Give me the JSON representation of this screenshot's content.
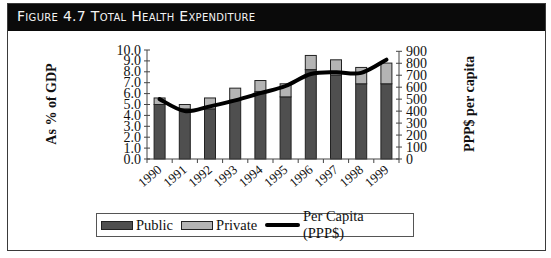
{
  "figure": {
    "title": "Figure 4.7 Total Health Expenditure"
  },
  "legend": {
    "items": [
      {
        "label": "Public",
        "type": "bar",
        "color": "#4f4f4f"
      },
      {
        "label": "Private",
        "type": "bar",
        "color": "#b4b4b4"
      },
      {
        "label": "Per Capita (PPP$)",
        "type": "line",
        "color": "#000000"
      }
    ]
  },
  "axes": {
    "left_label": "As % of GDP",
    "right_label": "PPP$ per capita",
    "left_ticks": [
      "0.0",
      "1.0",
      "2.0",
      "3.0",
      "4.0",
      "5.0",
      "6.0",
      "7.0",
      "8.0",
      "9.0",
      "10.0"
    ],
    "right_ticks": [
      "0",
      "100",
      "200",
      "300",
      "400",
      "500",
      "600",
      "700",
      "800",
      "900"
    ]
  },
  "chart_data": {
    "type": "bar",
    "stacked": true,
    "title": "Figure 4.7 Total Health Expenditure",
    "categories": [
      "1990",
      "1991",
      "1992",
      "1993",
      "1994",
      "1995",
      "1996",
      "1997",
      "1998",
      "1999"
    ],
    "series": [
      {
        "name": "Public",
        "axis": "left",
        "type": "bar",
        "values": [
          5.0,
          4.6,
          4.6,
          5.4,
          6.2,
          5.7,
          8.2,
          7.7,
          6.9,
          6.9
        ]
      },
      {
        "name": "Private",
        "axis": "left",
        "type": "bar",
        "values": [
          0.6,
          0.4,
          1.0,
          1.1,
          1.0,
          1.2,
          1.3,
          1.4,
          1.5,
          1.9
        ]
      },
      {
        "name": "Per Capita (PPP$)",
        "axis": "right",
        "type": "line",
        "values": [
          500,
          400,
          440,
          490,
          550,
          610,
          710,
          725,
          720,
          830
        ]
      }
    ],
    "xlabel": "",
    "ylabel": "As % of GDP",
    "y2label": "PPP$ per capita",
    "ylim": [
      0,
      10
    ],
    "y2lim": [
      0,
      900
    ],
    "grid": false,
    "legend_position": "bottom"
  }
}
